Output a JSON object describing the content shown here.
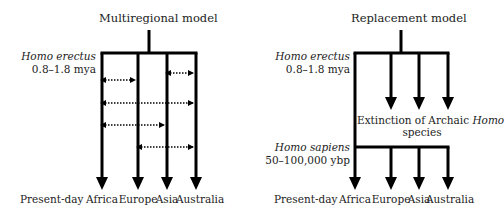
{
  "multiregional": {
    "title": "Multiregional model",
    "ancestor_name": "Homo erectus",
    "ancestor_date": "0.8–1.8 mya",
    "present_label": "Present-day",
    "regions": [
      "Africa",
      "Europe",
      "Asia",
      "Australia"
    ],
    "geometry": {
      "stem_x": 149,
      "stem_top": 30,
      "bar_y": 53,
      "lines_x": [
        102,
        138,
        167,
        196
      ],
      "line_bottom": 190,
      "gene_flow": [
        {
          "from": 2,
          "to": 3,
          "y": 73
        },
        {
          "from": 0,
          "to": 1,
          "y": 80
        },
        {
          "from": 0,
          "to": 3,
          "y": 103
        },
        {
          "from": 0,
          "to": 2,
          "y": 125
        },
        {
          "from": 1,
          "to": 3,
          "y": 147
        }
      ]
    }
  },
  "replacement": {
    "title": "Replacement model",
    "ancestor_name": "Homo erectus",
    "ancestor_date": "0.8–1.8 mya",
    "extinction_text_a": "Extinction of Archaic ",
    "extinction_text_b": "Homo",
    "extinction_text_c": "species",
    "sapiens_name": "Homo sapiens",
    "sapiens_date": "50–100,000 ybp",
    "present_label": "Present-day",
    "regions": [
      "Africa",
      "Europe",
      "Asia",
      "Australia"
    ],
    "geometry": {
      "stem_x": 401,
      "stem_top": 30,
      "bar_y": 53,
      "lines_x": [
        355,
        391,
        419,
        448
      ],
      "archaic_bottom": 110,
      "sapiens_bar_y": 147,
      "line_bottom": 190
    }
  },
  "colors": {
    "line": "#000000",
    "text": "#222222"
  }
}
